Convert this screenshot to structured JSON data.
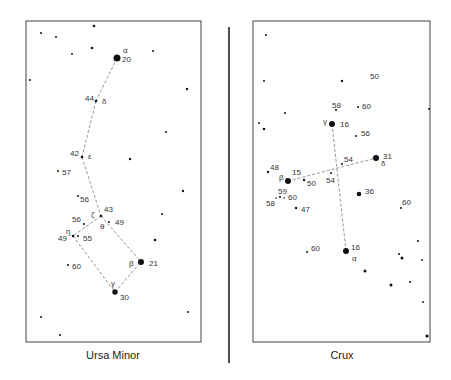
{
  "panels": [
    {
      "name": "ursa-minor",
      "caption": "Ursa Minor",
      "frame": {
        "x": 26,
        "y": 21,
        "w": 175,
        "h": 321
      },
      "caption_pos": {
        "x": 113,
        "y": 359
      },
      "stars": [
        {
          "x": 117,
          "y": 58,
          "r": 3.5,
          "mag": "20",
          "mx": 122,
          "my": 62,
          "greek": "α",
          "gx": 123,
          "gy": 53
        },
        {
          "x": 96,
          "y": 101,
          "r": 1.3,
          "mag": "44",
          "mx": 85,
          "my": 101,
          "greek": "δ",
          "gx": 102,
          "gy": 104
        },
        {
          "x": 82,
          "y": 157,
          "r": 1.3,
          "mag": "42",
          "mx": 70,
          "my": 156,
          "greek": "ε",
          "gx": 88,
          "gy": 159
        },
        {
          "x": 101,
          "y": 216,
          "r": 1.3,
          "mag": "43",
          "mx": 104,
          "my": 212,
          "greek": "ζ",
          "gx": 91,
          "gy": 217
        },
        {
          "x": 109,
          "y": 222,
          "r": 1,
          "mag": "49",
          "mx": 115,
          "my": 225,
          "greek": "θ",
          "gx": 100,
          "gy": 229
        },
        {
          "x": 73,
          "y": 236,
          "r": 1.3,
          "mag": "49",
          "mx": 58,
          "my": 241,
          "greek": "η",
          "gx": 66,
          "gy": 234
        },
        {
          "x": 78,
          "y": 236,
          "r": 1,
          "mag": "55",
          "mx": 83,
          "my": 241,
          "greek": "",
          "gx": 0,
          "gy": 0
        },
        {
          "x": 84,
          "y": 224,
          "r": 1,
          "mag": "56",
          "mx": 72,
          "my": 222,
          "greek": "",
          "gx": 0,
          "gy": 0
        },
        {
          "x": 78,
          "y": 196,
          "r": 1,
          "mag": "56",
          "mx": 80,
          "my": 202,
          "greek": "",
          "gx": 0,
          "gy": 0
        },
        {
          "x": 141,
          "y": 262,
          "r": 3,
          "mag": "21",
          "mx": 149,
          "my": 266,
          "greek": "β",
          "gx": 129,
          "gy": 266
        },
        {
          "x": 115,
          "y": 292,
          "r": 2.7,
          "mag": "30",
          "mx": 120,
          "my": 300,
          "greek": "γ",
          "gx": 111,
          "gy": 286
        },
        {
          "x": 58,
          "y": 171,
          "r": 1,
          "mag": "57",
          "mx": 62,
          "my": 175,
          "greek": "",
          "gx": 0,
          "gy": 0
        },
        {
          "x": 68,
          "y": 265,
          "r": 1,
          "mag": "60",
          "mx": 72,
          "my": 269,
          "greek": "",
          "gx": 0,
          "gy": 0
        },
        {
          "x": 94,
          "y": 26,
          "r": 1.3
        },
        {
          "x": 41,
          "y": 33,
          "r": 1
        },
        {
          "x": 56,
          "y": 37,
          "r": 1
        },
        {
          "x": 92,
          "y": 48,
          "r": 1.3
        },
        {
          "x": 72,
          "y": 54,
          "r": 1
        },
        {
          "x": 153,
          "y": 51,
          "r": 1
        },
        {
          "x": 30,
          "y": 80,
          "r": 1
        },
        {
          "x": 187,
          "y": 89,
          "r": 1.2
        },
        {
          "x": 166,
          "y": 132,
          "r": 1
        },
        {
          "x": 130,
          "y": 159,
          "r": 1.2
        },
        {
          "x": 183,
          "y": 191,
          "r": 1.2
        },
        {
          "x": 162,
          "y": 214,
          "r": 1
        },
        {
          "x": 155,
          "y": 240,
          "r": 1.3
        },
        {
          "x": 188,
          "y": 312,
          "r": 1
        },
        {
          "x": 41,
          "y": 317,
          "r": 1
        },
        {
          "x": 60,
          "y": 335,
          "r": 1
        }
      ],
      "links": [
        [
          117,
          58,
          96,
          101
        ],
        [
          96,
          101,
          82,
          157
        ],
        [
          82,
          157,
          101,
          216
        ],
        [
          101,
          216,
          73,
          236
        ],
        [
          101,
          216,
          141,
          262
        ],
        [
          73,
          236,
          115,
          292
        ],
        [
          115,
          292,
          141,
          262
        ]
      ]
    },
    {
      "name": "crux",
      "caption": "Crux",
      "frame": {
        "x": 253,
        "y": 21,
        "w": 177,
        "h": 321
      },
      "caption_pos": {
        "x": 342,
        "y": 359
      },
      "stars": [
        {
          "x": 332,
          "y": 124,
          "r": 3,
          "mag": "16",
          "mx": 340,
          "my": 127,
          "greek": "γ",
          "gx": 323,
          "gy": 124
        },
        {
          "x": 288,
          "y": 181,
          "r": 3,
          "mag": "15",
          "mx": 292,
          "my": 175,
          "greek": "β",
          "gx": 279,
          "gy": 180
        },
        {
          "x": 376,
          "y": 158,
          "r": 3,
          "mag": "31",
          "mx": 383,
          "my": 159,
          "greek": "δ",
          "gx": 381,
          "gy": 166
        },
        {
          "x": 346,
          "y": 251,
          "r": 3,
          "mag": "16",
          "mx": 351,
          "my": 250,
          "greek": "α",
          "gx": 352,
          "gy": 261
        },
        {
          "x": 359,
          "y": 194,
          "r": 2.3,
          "mag": "36",
          "mx": 365,
          "my": 194,
          "greek": "",
          "gx": 0,
          "gy": 0
        },
        {
          "x": 342,
          "y": 81,
          "r": 1.2,
          "mag": "50",
          "mx": 370,
          "my": 79,
          "greek": "",
          "gx": 0,
          "gy": 0
        },
        {
          "x": 336,
          "y": 110,
          "r": 1,
          "mag": "58",
          "mx": 332,
          "my": 108,
          "greek": "",
          "gx": 0,
          "gy": 0
        },
        {
          "x": 358,
          "y": 107,
          "r": 1,
          "mag": "60",
          "mx": 362,
          "my": 109,
          "greek": "",
          "gx": 0,
          "gy": 0
        },
        {
          "x": 356,
          "y": 136,
          "r": 1,
          "mag": "56",
          "mx": 361,
          "my": 136,
          "greek": "",
          "gx": 0,
          "gy": 0
        },
        {
          "x": 342,
          "y": 164,
          "r": 1,
          "mag": "54",
          "mx": 344,
          "my": 162,
          "greek": "",
          "gx": 0,
          "gy": 0
        },
        {
          "x": 331,
          "y": 173,
          "r": 1,
          "mag": "54",
          "mx": 326,
          "my": 183,
          "greek": "",
          "gx": 0,
          "gy": 0
        },
        {
          "x": 304,
          "y": 180,
          "r": 1.2,
          "mag": "50",
          "mx": 307,
          "my": 186,
          "greek": "",
          "gx": 0,
          "gy": 0
        },
        {
          "x": 268,
          "y": 172,
          "r": 1.2,
          "mag": "48",
          "mx": 270,
          "my": 170,
          "greek": "",
          "gx": 0,
          "gy": 0
        },
        {
          "x": 280,
          "y": 197,
          "r": 1,
          "mag": "59",
          "mx": 278,
          "my": 194,
          "greek": "",
          "gx": 0,
          "gy": 0
        },
        {
          "x": 276,
          "y": 198,
          "r": 0.8,
          "mag": "58",
          "mx": 266,
          "my": 206,
          "greek": "",
          "gx": 0,
          "gy": 0
        },
        {
          "x": 284,
          "y": 198,
          "r": 0.8,
          "mag": "60",
          "mx": 288,
          "my": 200,
          "greek": "",
          "gx": 0,
          "gy": 0
        },
        {
          "x": 296,
          "y": 208,
          "r": 1.2,
          "mag": "47",
          "mx": 301,
          "my": 212,
          "greek": "",
          "gx": 0,
          "gy": 0
        },
        {
          "x": 401,
          "y": 208,
          "r": 1,
          "mag": "60",
          "mx": 402,
          "my": 205,
          "greek": "",
          "gx": 0,
          "gy": 0
        },
        {
          "x": 307,
          "y": 252,
          "r": 1,
          "mag": "60",
          "mx": 311,
          "my": 251,
          "greek": "",
          "gx": 0,
          "gy": 0
        },
        {
          "x": 266,
          "y": 35,
          "r": 1
        },
        {
          "x": 264,
          "y": 81,
          "r": 1
        },
        {
          "x": 285,
          "y": 113,
          "r": 1
        },
        {
          "x": 259,
          "y": 123,
          "r": 0.9
        },
        {
          "x": 264,
          "y": 129,
          "r": 1.3
        },
        {
          "x": 429,
          "y": 109,
          "r": 1
        },
        {
          "x": 418,
          "y": 241,
          "r": 1
        },
        {
          "x": 399,
          "y": 254,
          "r": 1
        },
        {
          "x": 402,
          "y": 258,
          "r": 1.5
        },
        {
          "x": 422,
          "y": 260,
          "r": 0.9
        },
        {
          "x": 365,
          "y": 271,
          "r": 1.5
        },
        {
          "x": 391,
          "y": 285,
          "r": 1.5
        },
        {
          "x": 410,
          "y": 282,
          "r": 1
        },
        {
          "x": 423,
          "y": 302,
          "r": 0.9
        },
        {
          "x": 427,
          "y": 336,
          "r": 1.6
        }
      ],
      "links": [
        [
          332,
          124,
          346,
          251
        ],
        [
          288,
          181,
          376,
          158
        ]
      ]
    }
  ],
  "divider": {
    "x": 229,
    "y1": 27,
    "y2": 363
  }
}
